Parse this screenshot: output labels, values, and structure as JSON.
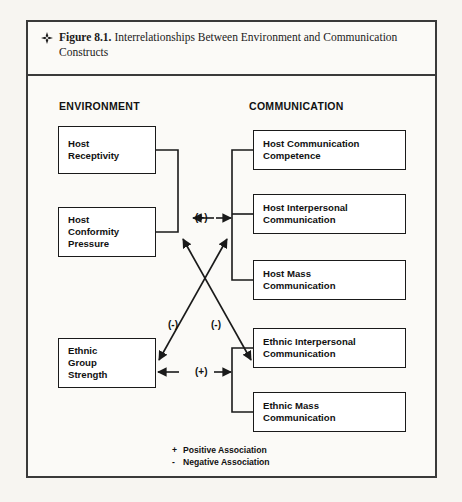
{
  "figure": {
    "icon": "diamond-bullet-icon",
    "label": "Figure 8.1.",
    "caption": " Interrelationships Between Environment and Communication Constructs"
  },
  "columns": {
    "left_heading": "ENVIRONMENT",
    "right_heading": "COMMUNICATION"
  },
  "nodes": {
    "host_receptivity": "Host\nReceptivity",
    "host_conformity_pressure": "Host\nConformity\nPressure",
    "ethnic_group_strength": "Ethnic\nGroup\nStrength",
    "host_communication_competence": "Host Communication\nCompetence",
    "host_interpersonal_communication": "Host Interpersonal\nCommunication",
    "host_mass_communication": "Host Mass\nCommunication",
    "ethnic_interpersonal_communication": "Ethnic Interpersonal\nCommunication",
    "ethnic_mass_communication": "Ethnic Mass\nCommunication"
  },
  "signs": {
    "host_env_to_host_comm": "(+)",
    "cross_left": "(-)",
    "cross_right": "(-)",
    "ethnic_to_ethnic_comm": "(+)"
  },
  "legend": {
    "positive_symbol": "+",
    "positive_label": "Positive Association",
    "negative_symbol": "-",
    "negative_label": "Negative Association"
  },
  "colors": {
    "page_background": "#f7f5f1",
    "figure_background": "#fbfaf7",
    "frame": "#3a3a3a",
    "node_border": "#1a1a1a",
    "text": "#111111"
  }
}
